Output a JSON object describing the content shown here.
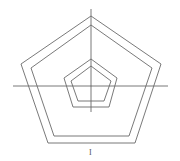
{
  "diagram": {
    "stroke_color": "#6a6a6a",
    "axis_color": "#555555",
    "shapes": [
      {
        "name": "outer-pentagon-outer",
        "points": [
          [
            91,
            16
          ],
          [
            161,
            64
          ],
          [
            135,
            143
          ],
          [
            48,
            143
          ],
          [
            21,
            64
          ]
        ]
      },
      {
        "name": "outer-pentagon-inner",
        "points": [
          [
            91,
            25
          ],
          [
            152,
            68
          ],
          [
            129,
            136
          ],
          [
            54,
            136
          ],
          [
            31,
            68
          ]
        ]
      },
      {
        "name": "inner-pentagon-outer",
        "points": [
          [
            91,
            59
          ],
          [
            117,
            78
          ],
          [
            109,
            107
          ],
          [
            73,
            107
          ],
          [
            64,
            78
          ]
        ]
      },
      {
        "name": "inner-pentagon-inner",
        "points": [
          [
            91,
            66
          ],
          [
            111,
            81
          ],
          [
            104,
            101
          ],
          [
            78,
            101
          ],
          [
            71,
            81
          ]
        ]
      }
    ],
    "axes": {
      "horizontal": {
        "x1": 13,
        "y1": 86,
        "x2": 168,
        "y2": 86
      },
      "vertical": {
        "x1": 91,
        "y1": 9,
        "x2": 91,
        "y2": 112
      }
    },
    "label": {
      "text": "I",
      "x": 89,
      "y": 148
    }
  }
}
